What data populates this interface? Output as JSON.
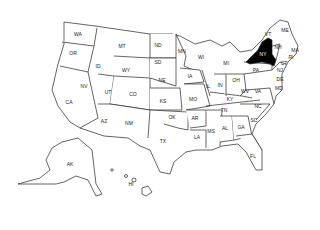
{
  "map": {
    "title": "United States",
    "highlighted_state": "NY",
    "highlight_color": "#000000",
    "background": "#ffffff"
  },
  "labels": [
    {
      "code": "WA",
      "x": 78,
      "y": 34
    },
    {
      "code": "OR",
      "x": 73,
      "y": 53
    },
    {
      "code": "ID",
      "x": 98,
      "y": 66
    },
    {
      "code": "MT",
      "x": 122,
      "y": 46
    },
    {
      "code": "WY",
      "x": 126,
      "y": 70
    },
    {
      "code": "CA",
      "x": 69,
      "y": 102
    },
    {
      "code": "NV",
      "x": 84,
      "y": 86
    },
    {
      "code": "UT",
      "x": 108,
      "y": 92
    },
    {
      "code": "CO",
      "x": 133,
      "y": 94
    },
    {
      "code": "AZ",
      "x": 104,
      "y": 121
    },
    {
      "code": "NM",
      "x": 129,
      "y": 123
    },
    {
      "code": "ND",
      "x": 158,
      "y": 45
    },
    {
      "code": "SD",
      "x": 158,
      "y": 62
    },
    {
      "code": "NE",
      "x": 162,
      "y": 80
    },
    {
      "code": "KS",
      "x": 163,
      "y": 101
    },
    {
      "code": "OK",
      "x": 172,
      "y": 117
    },
    {
      "code": "TX",
      "x": 163,
      "y": 141
    },
    {
      "code": "MN",
      "x": 182,
      "y": 51
    },
    {
      "code": "IA",
      "x": 190,
      "y": 76
    },
    {
      "code": "MO",
      "x": 193,
      "y": 99
    },
    {
      "code": "AR",
      "x": 195,
      "y": 118
    },
    {
      "code": "LA",
      "x": 197,
      "y": 137
    },
    {
      "code": "WI",
      "x": 201,
      "y": 57
    },
    {
      "code": "IL",
      "x": 208,
      "y": 86
    },
    {
      "code": "MS",
      "x": 211,
      "y": 131
    },
    {
      "code": "MI",
      "x": 226,
      "y": 63
    },
    {
      "code": "IN",
      "x": 220,
      "y": 85
    },
    {
      "code": "KY",
      "x": 230,
      "y": 99
    },
    {
      "code": "TN",
      "x": 224,
      "y": 110
    },
    {
      "code": "AL",
      "x": 225,
      "y": 128
    },
    {
      "code": "OH",
      "x": 236,
      "y": 80
    },
    {
      "code": "GA",
      "x": 241,
      "y": 127
    },
    {
      "code": "FL",
      "x": 253,
      "y": 156
    },
    {
      "code": "WV",
      "x": 245,
      "y": 91
    },
    {
      "code": "VA",
      "x": 258,
      "y": 91
    },
    {
      "code": "NC",
      "x": 258,
      "y": 106
    },
    {
      "code": "SC",
      "x": 254,
      "y": 120
    },
    {
      "code": "PA",
      "x": 256,
      "y": 70
    },
    {
      "code": "NY",
      "x": 263,
      "y": 54
    },
    {
      "code": "VT",
      "x": 268,
      "y": 34
    },
    {
      "code": "NH",
      "x": 278,
      "y": 47
    },
    {
      "code": "ME",
      "x": 285,
      "y": 30
    },
    {
      "code": "MA",
      "x": 295,
      "y": 50
    },
    {
      "code": "RI",
      "x": 291,
      "y": 57
    },
    {
      "code": "CT",
      "x": 284,
      "y": 63
    },
    {
      "code": "NJ",
      "x": 280,
      "y": 70
    },
    {
      "code": "DE",
      "x": 280,
      "y": 79
    },
    {
      "code": "MD",
      "x": 279,
      "y": 88
    },
    {
      "code": "AK",
      "x": 70,
      "y": 164
    },
    {
      "code": "HI",
      "x": 131,
      "y": 184
    }
  ]
}
